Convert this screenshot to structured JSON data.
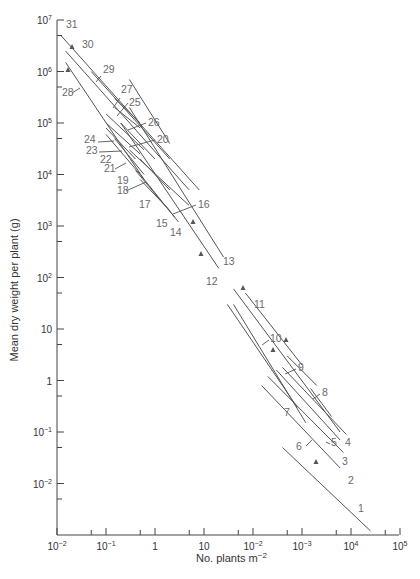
{
  "chart_data": {
    "type": "line",
    "title": "",
    "xlabel": "No. plants m⁻²",
    "ylabel": "Mean dry weight per plant (g)",
    "xscale": "log",
    "yscale": "log",
    "xlim": [
      0.01,
      100000
    ],
    "ylim": [
      0.001,
      10000000
    ],
    "grid": false,
    "legend": "none (lines labelled inline 1–31)",
    "x_ticks": [
      "10⁻²",
      "10⁻¹",
      "1",
      "10",
      "10⁻²",
      "10⁻³",
      "10⁴",
      "10⁵"
    ],
    "x_tick_note": "labels at 10^2 and 10^3 positions printed as 10⁻² and 10⁻³ in the figure",
    "y_ticks": [
      "10⁷",
      "10⁶",
      "10⁵",
      "10⁴",
      "10³",
      "10²",
      "10",
      "1",
      "10⁻¹",
      "10⁻²"
    ],
    "annotation": "Self-thinning lines, slope approximately −3/2 on log–log axes",
    "series": [
      {
        "name": "1",
        "x": [
          400,
          25000
        ],
        "y": [
          0.05,
          0.0012
        ]
      },
      {
        "name": "2",
        "x": [
          150,
          6000
        ],
        "y": [
          0.8,
          0.02
        ]
      },
      {
        "name": "3",
        "x": [
          200,
          7000
        ],
        "y": [
          1.2,
          0.04
        ]
      },
      {
        "name": "4",
        "x": [
          400,
          8000
        ],
        "y": [
          1.8,
          0.09
        ]
      },
      {
        "name": "5",
        "x": [
          300,
          6000
        ],
        "y": [
          1.6,
          0.07
        ]
      },
      {
        "name": "6",
        "x": [
          40,
          1200
        ],
        "y": [
          30,
          0.15
        ]
      },
      {
        "name": "7",
        "x": [
          30,
          800
        ],
        "y": [
          30,
          0.3
        ]
      },
      {
        "name": "8",
        "x": [
          1500,
          4000
        ],
        "y": [
          0.7,
          0.2
        ]
      },
      {
        "name": "9",
        "x": [
          500,
          2000
        ],
        "y": [
          3,
          0.8
        ]
      },
      {
        "name": "10",
        "x": [
          70,
          1000
        ],
        "y": [
          50,
          2
        ]
      },
      {
        "name": "11",
        "x": [
          40,
          6000
        ],
        "y": [
          60,
          0.1
        ]
      },
      {
        "name": "12",
        "x": [
          0.2,
          20
        ],
        "y": [
          100000,
          150
        ]
      },
      {
        "name": "13",
        "x": [
          0.3,
          25
        ],
        "y": [
          200000,
          250
        ]
      },
      {
        "name": "14",
        "x": [
          0.5,
          3
        ],
        "y": [
          10000,
          1200
        ]
      },
      {
        "name": "15",
        "x": [
          0.4,
          2.5
        ],
        "y": [
          12000,
          1500
        ]
      },
      {
        "name": "16",
        "x": [
          0.3,
          5
        ],
        "y": [
          30000,
          2500
        ]
      },
      {
        "name": "17",
        "x": [
          0.5,
          2
        ],
        "y": [
          8000,
          2000
        ]
      },
      {
        "name": "18",
        "x": [
          0.5,
          2
        ],
        "y": [
          20000,
          5000
        ]
      },
      {
        "name": "19",
        "x": [
          0.15,
          0.6
        ],
        "y": [
          50000,
          10000
        ]
      },
      {
        "name": "20",
        "x": [
          0.2,
          1
        ],
        "y": [
          100000,
          20000
        ]
      },
      {
        "name": "21",
        "x": [
          0.1,
          0.5
        ],
        "y": [
          60000,
          10000
        ]
      },
      {
        "name": "22",
        "x": [
          0.1,
          0.4
        ],
        "y": [
          80000,
          20000
        ]
      },
      {
        "name": "23",
        "x": [
          0.1,
          0.5
        ],
        "y": [
          100000,
          25000
        ]
      },
      {
        "name": "24",
        "x": [
          0.1,
          0.6
        ],
        "y": [
          150000,
          30000
        ]
      },
      {
        "name": "25",
        "x": [
          0.15,
          0.5
        ],
        "y": [
          200000,
          80000
        ]
      },
      {
        "name": "26",
        "x": [
          0.3,
          2
        ],
        "y": [
          700000,
          40000
        ]
      },
      {
        "name": "27",
        "x": [
          0.15,
          0.5
        ],
        "y": [
          300000,
          100000
        ]
      },
      {
        "name": "28",
        "x": [
          0.015,
          0.6
        ],
        "y": [
          1500000,
          8000
        ]
      },
      {
        "name": "29",
        "x": [
          0.05,
          2
        ],
        "y": [
          1000000,
          20000
        ]
      },
      {
        "name": "30",
        "x": [
          0.015,
          5
        ],
        "y": [
          2500000,
          5000
        ]
      },
      {
        "name": "31",
        "x": [
          0.012,
          8
        ],
        "y": [
          5000000,
          5000
        ]
      }
    ]
  },
  "labels": {
    "ylabel": "Mean dry weight per plant (g)",
    "xlabel_main": "No. plants m",
    "xlabel_sup": "−2"
  }
}
